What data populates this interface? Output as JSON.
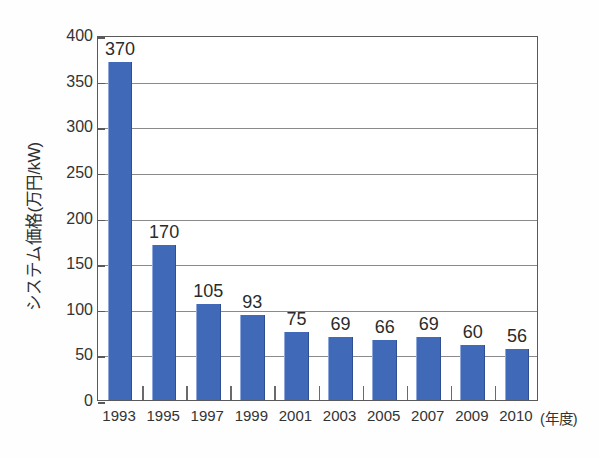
{
  "chart_data": {
    "type": "bar",
    "title": "",
    "subtitle": "",
    "xlabel": "(年度)",
    "ylabel": "システム価格(万円/kW)",
    "categories": [
      "1993",
      "1995",
      "1997",
      "1999",
      "2001",
      "2003",
      "2005",
      "2007",
      "2009",
      "2010"
    ],
    "values": [
      370,
      170,
      105,
      93,
      75,
      69,
      66,
      69,
      60,
      56
    ],
    "data_labels": [
      "370",
      "170",
      "105",
      "93",
      "75",
      "69",
      "66",
      "69",
      "60",
      "56"
    ],
    "ylim": [
      0,
      400
    ],
    "ytick_step": 50,
    "ytick_labels": [
      "400",
      "350",
      "300",
      "250",
      "200",
      "150",
      "100",
      "50",
      "0"
    ],
    "ytick_values": [
      400,
      350,
      300,
      250,
      200,
      150,
      100,
      50,
      0
    ],
    "grid": true,
    "grid_axis": "y",
    "legend": false,
    "legend_position": "none",
    "series": [
      {
        "name": "システム価格",
        "color": "#4069b8",
        "values": [
          370,
          170,
          105,
          93,
          75,
          69,
          66,
          69,
          60,
          56
        ]
      }
    ],
    "colors": {
      "bar": "#4069b8",
      "bar_edge_light": "#8fa9dd",
      "bar_edge_dark": "#2f4f92",
      "gridline": "#8a8a8a",
      "frame": "#5a5a5a",
      "text": "#333333",
      "background": "#fefefe"
    }
  }
}
